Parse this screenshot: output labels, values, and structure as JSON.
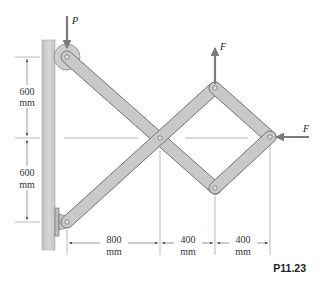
{
  "figure": {
    "label": "P11.23",
    "forces": {
      "top_left": "P",
      "top_right_pin": "F",
      "right_pin": "F"
    },
    "dimensions": {
      "vertical": [
        {
          "value": "600",
          "unit": "mm"
        },
        {
          "value": "600",
          "unit": "mm"
        }
      ],
      "horizontal": [
        {
          "value": "800",
          "unit": "mm"
        },
        {
          "value": "400",
          "unit": "mm"
        },
        {
          "value": "400",
          "unit": "mm"
        }
      ]
    },
    "colors": {
      "bar_fill": "#c9c9c9",
      "bar_stroke": "#6f6f6f",
      "wall_fill": "#cfcfcf",
      "force_arrow": "#7a7a7a",
      "dim_line": "#555555"
    }
  }
}
